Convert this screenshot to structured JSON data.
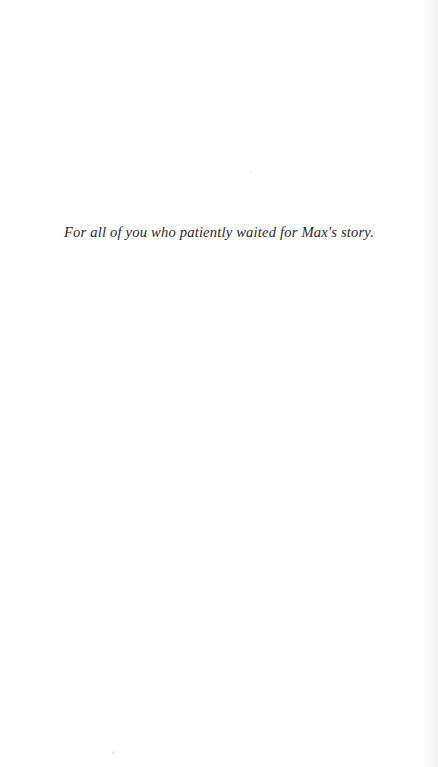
{
  "page": {
    "width": 438,
    "height": 767,
    "background_color": "#fefefe",
    "type": "book-dedication-page"
  },
  "dedication": {
    "text": "For all of you who patiently waited for Max's story.",
    "color": "#2b2b2b",
    "style": "italic-serif",
    "alignment": "center"
  },
  "artifacts": {
    "speck_top_name": "scan-speck",
    "speck_bottom_name": "scan-speck",
    "edge_shadow_name": "page-edge-shadow"
  }
}
